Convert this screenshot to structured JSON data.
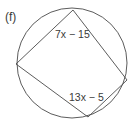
{
  "figure": {
    "part_label": "(f)",
    "angle_labels": {
      "top": "7x − 15",
      "bottom": "13x − 5"
    },
    "colors": {
      "stroke": "#4a4a4a",
      "text": "#3a3a3a",
      "background": "#ffffff"
    }
  }
}
